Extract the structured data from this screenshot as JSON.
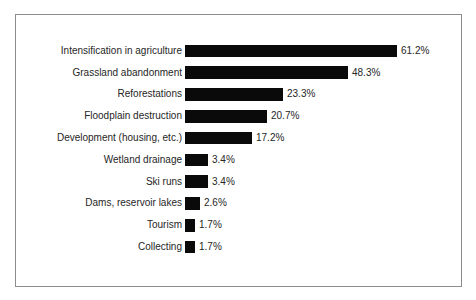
{
  "chart_data": {
    "type": "bar",
    "orientation": "horizontal",
    "title": "",
    "xlabel": "",
    "ylabel": "",
    "unit": "%",
    "categories": [
      "Intensification in agriculture",
      "Grassland abandonment",
      "Reforestations",
      "Floodplain destruction",
      "Development (housing, etc.)",
      "Wetland drainage",
      "Ski runs",
      "Dams, reservoir lakes",
      "Tourism",
      "Collecting"
    ],
    "values": [
      61.2,
      48.3,
      23.3,
      20.7,
      17.2,
      3.4,
      3.4,
      2.6,
      1.7,
      1.7
    ],
    "value_labels": [
      "61.2%",
      "48.3%",
      "23.3%",
      "20.7%",
      "17.2%",
      "3.4%",
      "3.4%",
      "2.6%",
      "1.7%",
      "1.7%"
    ],
    "xlim": [
      0,
      65
    ],
    "grid": false,
    "legend": false,
    "bar_color": "#0a0a0a",
    "text_color": "#262626",
    "frame_border_color": "#8c8c8c",
    "layout_hints": {
      "bar_px_widths": [
        212,
        163,
        98,
        82,
        67,
        23,
        23,
        15,
        10,
        10
      ]
    }
  }
}
